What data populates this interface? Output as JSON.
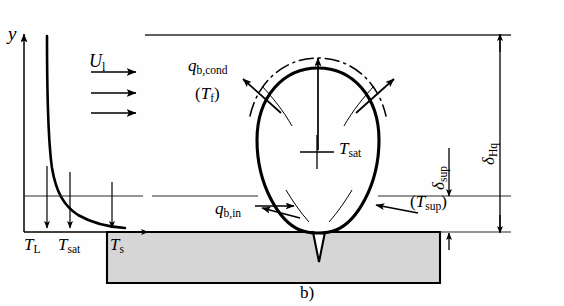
{
  "figure": {
    "caption": "b)",
    "domain_kind": "boiling-heat-transfer-schematic"
  },
  "axes": {
    "y_axis_label": "y"
  },
  "flow": {
    "velocity_label_symbol": "U",
    "velocity_label_sub": "l",
    "arrow_count": 3
  },
  "temperature_ticks": [
    {
      "symbol": "T",
      "sub": "L"
    },
    {
      "symbol": "T",
      "sub": "sat"
    },
    {
      "symbol": "T",
      "sub": "s"
    }
  ],
  "heat_flux_labels": {
    "conduction": {
      "symbol": "q",
      "sub": "b,cond"
    },
    "film_temp": {
      "symbol": "T",
      "sub": "f",
      "paren": true
    },
    "inflow": {
      "symbol": "q",
      "sub": "b,in"
    },
    "superheat_temp": {
      "symbol": "T",
      "sub": "sup",
      "paren": true
    }
  },
  "bubble": {
    "center_label_symbol": "T",
    "center_label_sub": "sat"
  },
  "thickness_labels": {
    "bulk": {
      "symbol": "δ",
      "sub": "Hq"
    },
    "superheat": {
      "symbol": "δ",
      "sub": "sup"
    }
  },
  "colors": {
    "line": "#000000",
    "heater_fill": "#d6d6d6",
    "background": "#fefefe",
    "thin_line": "#2a2a2a"
  }
}
